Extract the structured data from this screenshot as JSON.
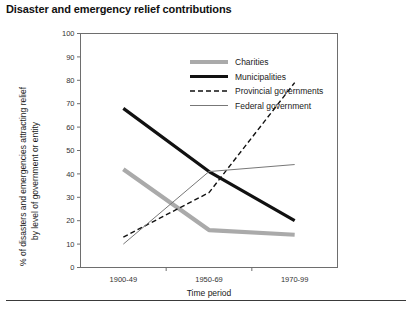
{
  "chart_title": "Disaster and emergency relief contributions",
  "axes": {
    "y_label": "% of disasters and emergencies attracting relief by level of government or entity",
    "y_label_line1": "% of disasters and emergencies attracting relief",
    "y_label_line2": "by level of government or entity",
    "x_label": "Time period",
    "y_ticks": [
      "0",
      "10",
      "20",
      "30",
      "40",
      "50",
      "60",
      "70",
      "80",
      "90",
      "100"
    ],
    "x_ticks": [
      "1900-49",
      "1950-69",
      "1970-99"
    ]
  },
  "legend": {
    "position": "top-center-inside",
    "entries": [
      {
        "label": "Charities",
        "style": "thick-solid-grey",
        "color": "#aaaaaa"
      },
      {
        "label": "Municipalities",
        "style": "thick-solid-black",
        "color": "#111111"
      },
      {
        "label": "Provincial governments",
        "style": "dashed-black",
        "color": "#111111"
      },
      {
        "label": "Federal government",
        "style": "thin-solid-grey",
        "color": "#777777"
      }
    ]
  },
  "colors": {
    "charities": "#aaaaaa",
    "municipalities": "#111111",
    "provincial": "#111111",
    "federal": "#777777",
    "frame": "#6e6e6e",
    "text": "#1a1a1a"
  },
  "chart_data": {
    "type": "line",
    "title": "Disaster and emergency relief contributions",
    "xlabel": "Time period",
    "ylabel": "% of disasters and emergencies attracting relief by level of government or entity",
    "categories": [
      "1900-49",
      "1950-69",
      "1970-99"
    ],
    "ylim": [
      0,
      100
    ],
    "ytick_step": 10,
    "grid": false,
    "legend": "inside top-center",
    "series": [
      {
        "name": "Charities",
        "values": [
          42,
          16,
          14
        ],
        "color": "#aaaaaa",
        "style": "thick-solid"
      },
      {
        "name": "Municipalities",
        "values": [
          68,
          41,
          20
        ],
        "color": "#111111",
        "style": "thick-solid"
      },
      {
        "name": "Provincial governments",
        "values": [
          13,
          32,
          79
        ],
        "color": "#111111",
        "style": "dashed"
      },
      {
        "name": "Federal government",
        "values": [
          10,
          41,
          44
        ],
        "color": "#777777",
        "style": "thin-solid"
      }
    ]
  }
}
